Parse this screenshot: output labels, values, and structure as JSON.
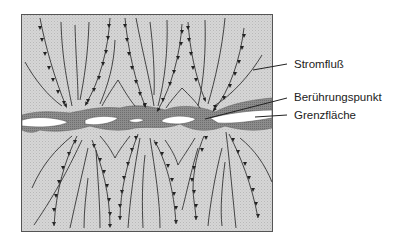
{
  "figure": {
    "colors": {
      "material": "#d4d4d4",
      "interface_band": "#8a8a8a",
      "gap": "#ffffff",
      "lines": "#333333",
      "border": "#555555"
    }
  },
  "labels": {
    "current_flow": "Stromfluß",
    "contact_point": "Berührungspunkt",
    "interface": "Grenzfläche"
  }
}
